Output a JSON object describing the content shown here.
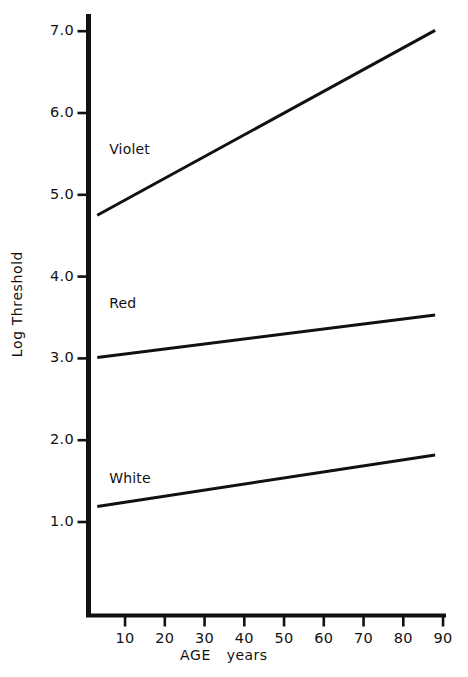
{
  "chart_data": {
    "type": "line",
    "title": "",
    "subtitle": "",
    "xlabel": "AGE",
    "xunit": "years",
    "ylabel": "Log Threshold",
    "xlim": [
      0,
      90
    ],
    "ylim": [
      0.45,
      7.35
    ],
    "grid": false,
    "legend_position": "inline-left",
    "x_ticks": [
      10,
      20,
      30,
      40,
      50,
      60,
      70,
      80,
      90
    ],
    "x_tick_labels": [
      "10",
      "20",
      "30",
      "40",
      "50",
      "60",
      "70",
      "80",
      "90"
    ],
    "y_ticks": [
      1.0,
      2.0,
      3.0,
      4.0,
      5.0,
      6.0,
      7.0
    ],
    "y_tick_labels": [
      "1.0",
      "2.0",
      "3.0",
      "4.0",
      "5.0",
      "6.0",
      "7.0"
    ],
    "line_color": "#111111",
    "axis_color": "#111111",
    "series": [
      {
        "name": "Violet",
        "x": [
          3,
          88
        ],
        "values": [
          4.75,
          7.01
        ],
        "label_x": 6,
        "label_y": 5.55
      },
      {
        "name": "Red",
        "x": [
          3,
          88
        ],
        "values": [
          3.01,
          3.53
        ],
        "label_x": 6,
        "label_y": 3.67
      },
      {
        "name": "White",
        "x": [
          3,
          88
        ],
        "values": [
          1.19,
          1.82
        ],
        "label_x": 6,
        "label_y": 1.52
      }
    ]
  },
  "axis_titles": {
    "y": "Log Threshold",
    "x_main": "AGE",
    "x_unit": "years"
  }
}
